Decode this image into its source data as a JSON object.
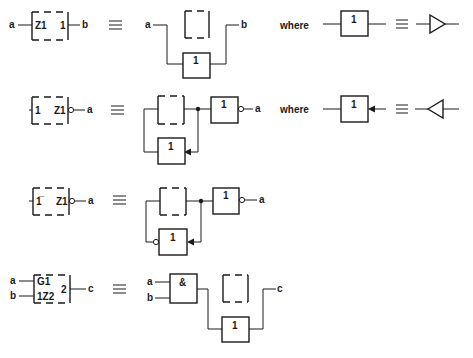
{
  "equivalence_symbol": "≡",
  "where_label": "where",
  "rows": [
    {
      "id": "row1",
      "symbol": {
        "left_label": "Z1",
        "right_label": "1",
        "input": "a",
        "output": "b"
      },
      "equivalent": {
        "input": "a",
        "output": "b",
        "gate_label": "1"
      },
      "where": {
        "gate_label": "1",
        "equivalent_icon": "buffer-triangle-right-icon"
      }
    },
    {
      "id": "row2",
      "symbol": {
        "left_label": "1",
        "right_label": "Z1",
        "output": "a",
        "output_negated": true
      },
      "equivalent": {
        "output": "a",
        "gate_label_top": "1",
        "gate_label_bottom": "1"
      },
      "where": {
        "gate_label": "1",
        "equivalent_icon": "buffer-triangle-left-icon"
      }
    },
    {
      "id": "row3",
      "symbol": {
        "left_label": "1̅",
        "right_label": "Z1",
        "output": "a",
        "output_negated": true
      },
      "equivalent": {
        "output": "a",
        "gate_label_top": "1",
        "gate_label_bottom": "1",
        "bottom_input_negated": true
      }
    },
    {
      "id": "row4",
      "symbol": {
        "label_top": "G1",
        "label_bottom": "1Z2",
        "right_label": "2",
        "input_a": "a",
        "input_b": "b",
        "output": "c"
      },
      "equivalent": {
        "input_a": "a",
        "input_b": "b",
        "output": "c",
        "and_label": "&",
        "gate_label": "1"
      }
    }
  ]
}
